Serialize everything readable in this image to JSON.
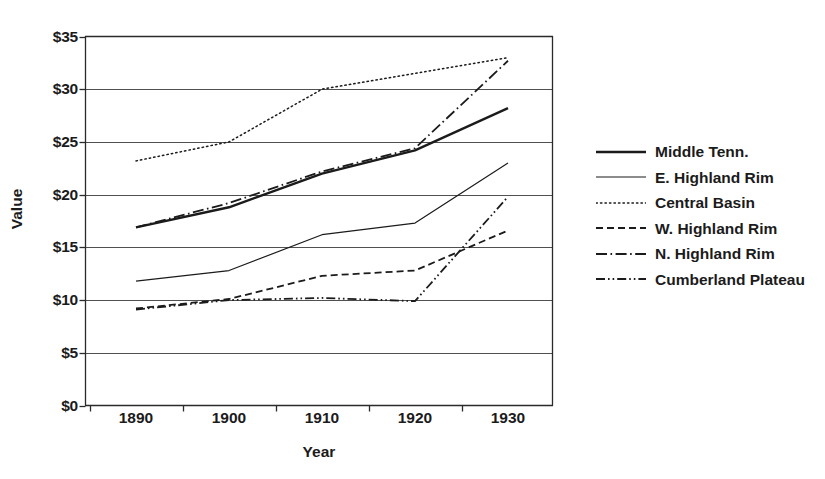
{
  "chart_data": {
    "type": "line",
    "title": "",
    "xlabel": "Year",
    "ylabel": "Value",
    "categories": [
      "1890",
      "1900",
      "1910",
      "1920",
      "1930"
    ],
    "x": [
      1890,
      1900,
      1910,
      1920,
      1930
    ],
    "xlim": [
      1890,
      1930
    ],
    "ylim": [
      0,
      35
    ],
    "y_ticks": [
      0,
      5,
      10,
      15,
      20,
      25,
      30,
      35
    ],
    "y_tick_labels": [
      "$0",
      "$5",
      "$10",
      "$15",
      "$20",
      "$25",
      "$30",
      "$35"
    ],
    "y_tick_prefix": "$",
    "grid": "horizontal",
    "legend_position": "right",
    "line_color": "#1b1b1b",
    "series": [
      {
        "name": "Middle Tenn.",
        "values": [
          16.9,
          18.8,
          22.0,
          24.2,
          28.2
        ],
        "style": "solid",
        "width": 2.4,
        "dash": ""
      },
      {
        "name": "E. Highland Rim",
        "values": [
          11.8,
          12.8,
          16.2,
          17.3,
          23.0
        ],
        "style": "solid-thin",
        "width": 1.2,
        "dash": ""
      },
      {
        "name": "Central Basin",
        "values": [
          23.2,
          25.0,
          30.0,
          31.5,
          33.0
        ],
        "style": "dotted",
        "width": 1.5,
        "dash": "1.4 3.1"
      },
      {
        "name": "W. Highland Rim",
        "values": [
          9.2,
          10.1,
          12.3,
          12.8,
          16.6
        ],
        "style": "dashed",
        "width": 1.8,
        "dash": "7 4"
      },
      {
        "name": "N. Highland Rim",
        "values": [
          16.9,
          19.2,
          22.2,
          24.4,
          32.7
        ],
        "style": "dash-dot",
        "width": 1.8,
        "dash": "11 3.5 1.6 3.5"
      },
      {
        "name": "Cumberland Plateau",
        "values": [
          9.1,
          10.0,
          10.2,
          9.9,
          19.8
        ],
        "style": "dash-dot-dot",
        "width": 1.8,
        "dash": "9 3 1.6 3 1.6 3"
      }
    ]
  },
  "axes": {
    "x_title": "Year",
    "y_title": "Value"
  }
}
